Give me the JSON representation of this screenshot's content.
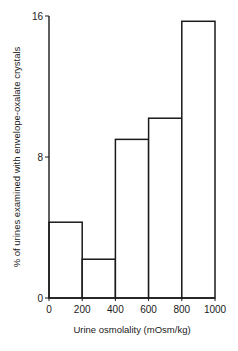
{
  "chart_data": {
    "type": "bar",
    "title": "",
    "xlabel": "Urine osmolality (mOsm/kg)",
    "ylabel": "% of urines examined with envelope-oxalate crystals",
    "x_bins": [
      [
        0,
        200
      ],
      [
        200,
        400
      ],
      [
        400,
        600
      ],
      [
        600,
        800
      ],
      [
        800,
        1000
      ]
    ],
    "categories": [
      "0-200",
      "200-400",
      "400-600",
      "600-800",
      "800-1000"
    ],
    "values": [
      4.3,
      2.2,
      9.0,
      10.2,
      15.7
    ],
    "x_ticks": [
      "0",
      "200",
      "400",
      "600",
      "800",
      "1000"
    ],
    "y_ticks": [
      "0",
      "8",
      "16"
    ],
    "xlim": [
      0,
      1000
    ],
    "ylim": [
      0,
      16
    ],
    "grid": false,
    "legend": null
  }
}
